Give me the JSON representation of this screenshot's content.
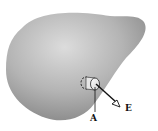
{
  "diagram": {
    "labels": {
      "point": "A",
      "field": "E"
    },
    "colors": {
      "conductor_light": "#d8d8d8",
      "conductor_dark": "#8c8c8c",
      "pillbox": "#f2f2f2",
      "line": "#111111"
    }
  }
}
